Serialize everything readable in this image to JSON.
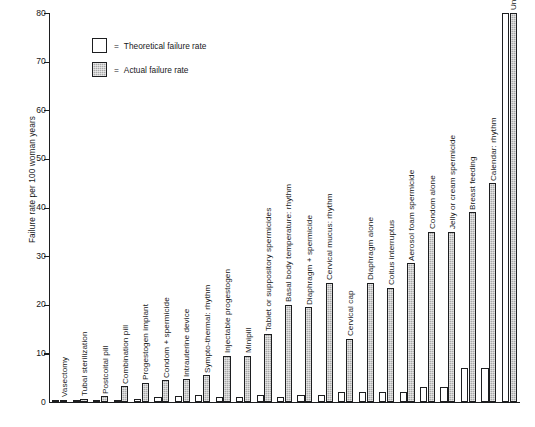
{
  "chart_data": {
    "type": "bar",
    "title": "",
    "xlabel": "",
    "ylabel": "Failure rate per 100 woman years",
    "ylim": [
      0,
      80
    ],
    "yticks": [
      0,
      10,
      20,
      30,
      40,
      50,
      60,
      70,
      80
    ],
    "grid": false,
    "legend_position": "top-left-inside",
    "categories": [
      "Vasectomy",
      "Tubal sterilization",
      "Postcoital pill",
      "Combination pill",
      "Progestogen implant",
      "Condom + spermicide",
      "Intrauterine device",
      "Sympto-thermal: rhythm",
      "Injectable progestogen",
      "Minipill",
      "Tablet or suppository spermicides",
      "Basal body temperature: rhythm",
      "Diaphragm + spermicide",
      "Cervical mucus: rhythm",
      "Cervical cap",
      "Diaphragm alone",
      "Coitus interruptus",
      "Aerosol foam spermicide",
      "Condom alone",
      "Jelly or cream spermicide",
      "Breast feeding",
      "Calendar: rhythm",
      "Unprotected coitus"
    ],
    "series": [
      {
        "name": "Theoretical failure rate",
        "color": "#ffffff",
        "values": [
          0.2,
          0.3,
          0.5,
          0.5,
          0.6,
          1,
          1.3,
          1.5,
          1,
          1,
          1.5,
          1,
          1.5,
          1.5,
          2,
          2,
          2,
          2,
          3,
          3,
          7,
          7,
          80
        ]
      },
      {
        "name": "Actual failure rate",
        "color": "#a9a9a9",
        "values": [
          0.5,
          0.7,
          1.2,
          3.2,
          4,
          4.5,
          4.7,
          5.5,
          9.5,
          9.5,
          14,
          20,
          19.5,
          24.5,
          13,
          24.5,
          23.5,
          28.5,
          35,
          35,
          39,
          45,
          80
        ]
      }
    ],
    "legend": [
      {
        "label": "Theoretical failure rate",
        "swatch": "theoretical",
        "equals": "="
      },
      {
        "label": "Actual failure rate",
        "swatch": "actual",
        "equals": "="
      }
    ]
  }
}
